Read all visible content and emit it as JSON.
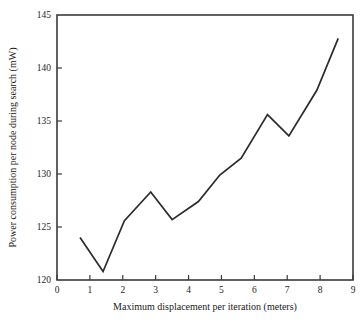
{
  "chart_data": {
    "type": "line",
    "title": "",
    "xlabel": "Maximum displacement per iteration (meters)",
    "ylabel": "Power consumption per node during search (mW)",
    "xlim": [
      0,
      9
    ],
    "ylim": [
      120,
      145
    ],
    "xticks": [
      0,
      1,
      2,
      3,
      4,
      5,
      6,
      7,
      8,
      9
    ],
    "yticks": [
      120,
      125,
      130,
      135,
      140,
      145
    ],
    "xtick_labels": [
      "0",
      "1",
      "2",
      "3",
      "4",
      "5",
      "6",
      "7",
      "8",
      "9"
    ],
    "ytick_labels": [
      "120",
      "125",
      "130",
      "135",
      "140",
      "145"
    ],
    "grid": false,
    "legend": null,
    "series": [
      {
        "name": "Power consumption per node during search",
        "color": "#2b2b2b",
        "x": [
          0.7,
          1.4,
          2.05,
          2.85,
          3.5,
          4.3,
          4.95,
          5.6,
          6.4,
          7.05,
          7.9,
          8.55
        ],
        "y": [
          124.0,
          120.8,
          125.6,
          128.3,
          125.7,
          127.4,
          129.9,
          131.5,
          135.6,
          133.6,
          137.9,
          142.8
        ]
      }
    ]
  },
  "axes": {
    "x_title": "Maximum displacement per iteration (meters)",
    "y_title": "Power consumption per node during search (mW)"
  }
}
